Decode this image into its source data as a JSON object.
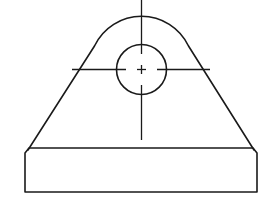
{
  "drawing": {
    "title": "Lifting lug / bracket — front view",
    "stroke_color": "#1a1a1a",
    "background": "#ffffff",
    "hole": {
      "cx": 141.5,
      "cy": 69.5,
      "r": 25
    },
    "arc": {
      "cx": 141.5,
      "cy": 69.5,
      "r": 52,
      "top_y": 17
    },
    "tangent_left": {
      "from": [
        28,
        150
      ],
      "to": [
        94,
        46
      ]
    },
    "tangent_right": {
      "from": [
        189,
        46
      ],
      "to": [
        254,
        150
      ]
    },
    "base": {
      "x": 25,
      "y": 148,
      "width": 232,
      "height": 44,
      "corner_chamfer": 4
    },
    "center_lines": {
      "horizontal": {
        "y": 69.5,
        "x_start": 72,
        "x_end": 210,
        "gap_left": [
          126,
          136
        ],
        "gap_right": [
          147,
          157
        ]
      },
      "vertical": {
        "x": 141.5,
        "y_start": 0,
        "y_end": 140,
        "gap_top": [
          54,
          65
        ],
        "gap_bottom": [
          74,
          85
        ]
      }
    }
  }
}
